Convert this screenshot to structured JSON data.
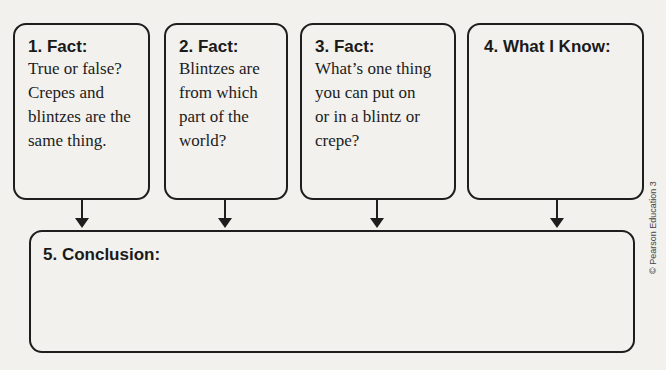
{
  "boxes": [
    {
      "title": "1. Fact:",
      "lines": [
        "True or false?",
        "Crepes and",
        "blintzes are the",
        "same thing."
      ]
    },
    {
      "title": "2. Fact:",
      "lines": [
        "Blintzes are",
        "from which",
        "part of the",
        "world?"
      ]
    },
    {
      "title": "3. Fact:",
      "lines": [
        "What’s one thing",
        "you can put on",
        "or in a blintz or",
        "crepe?"
      ]
    },
    {
      "title": "4. What I Know:",
      "lines": []
    }
  ],
  "conclusion": {
    "title": "5. Conclusion:"
  },
  "copyright": "© Pearson Education 3",
  "colors": {
    "background": "#f2f1ee",
    "border": "#1e1e1e",
    "text": "#1a1a1a"
  }
}
